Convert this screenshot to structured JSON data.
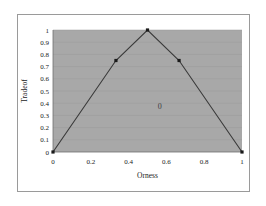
{
  "chart_data": {
    "type": "line",
    "title": "",
    "xlabel": "Orness",
    "ylabel": "Tradeof",
    "xlim": [
      0,
      1
    ],
    "ylim": [
      0,
      1
    ],
    "xticks": [
      "0",
      "0.2",
      "0.4",
      "0.6",
      "0.8",
      "1"
    ],
    "xtick_values": [
      0,
      0.2,
      0.4,
      0.6,
      0.8,
      1
    ],
    "yticks": [
      "0",
      "0.1",
      "0.2",
      "0.3",
      "0.4",
      "0.5",
      "0.6",
      "0.7",
      "0.8",
      "0.9",
      "1"
    ],
    "ytick_values": [
      0,
      0.1,
      0.2,
      0.3,
      0.4,
      0.5,
      0.6,
      0.7,
      0.8,
      0.9,
      1
    ],
    "grid": "horizontal",
    "legend": "none",
    "plot_background": "#a8a8a8",
    "line_color": "#3a3a3a",
    "marker_color": "#1a1a1a",
    "marker": "square",
    "series": [
      {
        "name": "Tradeoff",
        "x": [
          0,
          0.333,
          0.5,
          0.667,
          1
        ],
        "y": [
          0,
          0.75,
          1,
          0.75,
          0
        ]
      }
    ],
    "annotations": [
      {
        "text": "0",
        "x": 0.565,
        "y": 0.35
      }
    ]
  }
}
